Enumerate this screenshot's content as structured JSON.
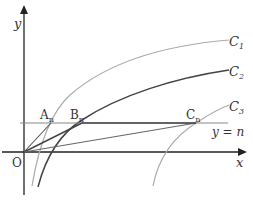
{
  "diagram": {
    "axes": {
      "x_label": "x",
      "y_label": "y",
      "origin_label": "O"
    },
    "curves": [
      {
        "name": "C",
        "sub": "1",
        "color": "#aaaaaa"
      },
      {
        "name": "C",
        "sub": "2",
        "color": "#444444"
      },
      {
        "name": "C",
        "sub": "3",
        "color": "#aaaaaa"
      }
    ],
    "line": {
      "label": "y = n",
      "color": "#888888"
    },
    "points": [
      {
        "name": "A",
        "sub": "n"
      },
      {
        "name": "B",
        "sub": "n"
      },
      {
        "name": "C",
        "sub": "n"
      }
    ],
    "colors": {
      "axis": "#222222",
      "segment": "#555555",
      "light_curve": "#aaaaaa",
      "dark_curve": "#444444"
    }
  }
}
